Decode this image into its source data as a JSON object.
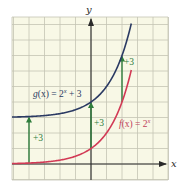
{
  "chart_data": {
    "type": "line",
    "title": "",
    "xlabel": "x",
    "ylabel": "y",
    "xlim": [
      -5.1,
      5.0
    ],
    "ylim": [
      -1.0,
      9.5
    ],
    "grid": true,
    "grid_step": 1,
    "series": [
      {
        "name": "g(x) = 2^x + 3",
        "label_parts": {
          "prefix": "g",
          "arg": "(x) = 2",
          "exp": "x",
          "suffix": " + 3"
        },
        "color": "#2b3a63",
        "x_range": [
          -5.1,
          2.6
        ],
        "formula": "2^x + 3"
      },
      {
        "name": "f(x) = 2^x",
        "label_parts": {
          "prefix": "f",
          "arg": "(x) = 2",
          "exp": "x",
          "suffix": ""
        },
        "color": "#d23a55",
        "x_range": [
          -5.1,
          2.6
        ],
        "formula": "2^x"
      }
    ],
    "annotations": [
      {
        "type": "arrow",
        "x": -4,
        "from_y": 0.0625,
        "to_y": 3.0625,
        "label": "+3"
      },
      {
        "type": "arrow",
        "x": 0,
        "from_y": 1,
        "to_y": 4,
        "label": "+3"
      },
      {
        "type": "arrow",
        "x": 2,
        "from_y": 4,
        "to_y": 7,
        "label": "+3"
      }
    ]
  },
  "labels": {
    "x_axis": "x",
    "y_axis": "y",
    "g_label_prefix": "g",
    "g_label_mid": "(x) = 2",
    "g_label_exp": "x",
    "g_label_suffix": " + 3",
    "f_label_prefix": "f",
    "f_label_mid": "(x) = 2",
    "f_label_exp": "x",
    "shift_left": "+3",
    "shift_middle": "+3",
    "shift_right": "+3"
  },
  "colors": {
    "background": "#f8f8e6",
    "grid": "#c4c4b4",
    "axis": "#2a2a2a",
    "g_curve": "#2b3a63",
    "f_curve": "#d23a55",
    "shift_arrow": "#2f7d3c",
    "f_label": "#c0405a",
    "shift_label": "#2f7d3c"
  }
}
